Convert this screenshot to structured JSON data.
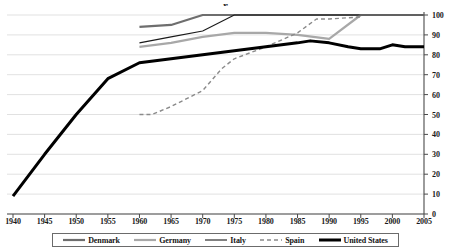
{
  "chart_data": {
    "type": "line",
    "title": "",
    "title_fragment_visible": "r",
    "xlabel": "",
    "ylabel": "",
    "xlim": [
      1940,
      2005
    ],
    "ylim": [
      0,
      100
    ],
    "xticks": [
      1940,
      1945,
      1950,
      1955,
      1960,
      1965,
      1970,
      1975,
      1980,
      1985,
      1990,
      1995,
      2000,
      2005
    ],
    "yticks": [
      0,
      10,
      20,
      30,
      40,
      50,
      60,
      70,
      80,
      90,
      100
    ],
    "y_axis_position": "right",
    "grid": "horizontal",
    "legend_position": "bottom",
    "series": [
      {
        "name": "Denmark",
        "color": "#6e6e6e",
        "style": "solid-thick",
        "x": [
          1960,
          1965,
          1970,
          1975,
          1980,
          1985,
          1990,
          1995,
          2000,
          2005
        ],
        "values": [
          94,
          95,
          100,
          100,
          100,
          100,
          100,
          100,
          100,
          100
        ]
      },
      {
        "name": "Germany",
        "color": "#a8a8a8",
        "style": "solid-thick",
        "x": [
          1960,
          1965,
          1970,
          1975,
          1980,
          1985,
          1990,
          1995,
          2000,
          2005
        ],
        "values": [
          84,
          86,
          89,
          91,
          91,
          90,
          88,
          100,
          100,
          100
        ]
      },
      {
        "name": "Italy",
        "color": "#1a1a1a",
        "style": "solid-thin",
        "x": [
          1960,
          1965,
          1970,
          1975,
          1980,
          1985,
          1990,
          1995,
          2000,
          2005
        ],
        "values": [
          86,
          89,
          92,
          100,
          100,
          100,
          100,
          100,
          100,
          100
        ]
      },
      {
        "name": "Spain",
        "color": "#8a8a8a",
        "style": "dashed",
        "x": [
          1960,
          1962,
          1965,
          1970,
          1973,
          1975,
          1980,
          1985,
          1988,
          1990,
          1995
        ],
        "values": [
          50,
          50,
          54,
          62,
          73,
          78,
          84,
          91,
          98,
          98,
          99
        ]
      },
      {
        "name": "United States",
        "color": "#000000",
        "style": "solid-extra-thick",
        "x": [
          1940,
          1945,
          1950,
          1955,
          1960,
          1965,
          1970,
          1975,
          1980,
          1985,
          1987,
          1990,
          1993,
          1995,
          1998,
          2000,
          2002,
          2005
        ],
        "values": [
          9,
          30,
          50,
          68,
          76,
          78,
          80,
          82,
          84,
          86,
          87,
          86,
          84,
          83,
          83,
          85,
          84,
          84
        ]
      }
    ]
  },
  "axes": {
    "y_tick_labels": [
      "100",
      "90",
      "80",
      "70",
      "60",
      "50",
      "40",
      "30",
      "20",
      "10",
      "0"
    ],
    "x_tick_labels": [
      "1940",
      "1945",
      "1950",
      "1955",
      "1960",
      "1965",
      "1970",
      "1975",
      "1980",
      "1985",
      "1990",
      "1995",
      "2000",
      "2005"
    ]
  },
  "legend": {
    "items": [
      {
        "label": "Denmark",
        "color": "#6e6e6e",
        "style": "solid-thick"
      },
      {
        "label": "Germany",
        "color": "#a8a8a8",
        "style": "solid-thick"
      },
      {
        "label": "Italy",
        "color": "#1a1a1a",
        "style": "solid-thin"
      },
      {
        "label": "Spain",
        "color": "#8a8a8a",
        "style": "dashed"
      },
      {
        "label": "United States",
        "color": "#000000",
        "style": "solid-extra-thick"
      }
    ]
  },
  "colors": {
    "grid": "#d9d9d9",
    "axis": "#4a4a4a",
    "background": "#ffffff",
    "legend_border": "#6b6b6b"
  }
}
